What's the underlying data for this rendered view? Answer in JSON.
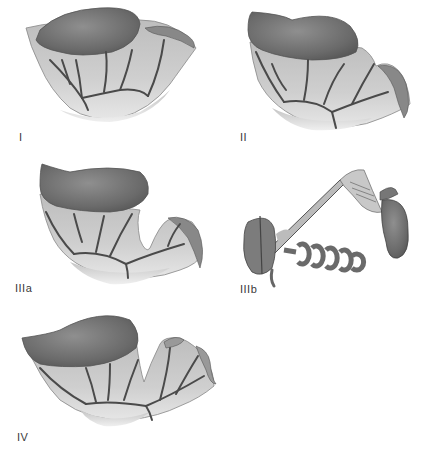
{
  "figure": {
    "title": "",
    "panels": [
      {
        "id": "I",
        "label": "I"
      },
      {
        "id": "II",
        "label": "II"
      },
      {
        "id": "IIIa",
        "label": "IIIa"
      },
      {
        "id": "IIIb",
        "label": "IIIb"
      },
      {
        "id": "IV",
        "label": "IV"
      }
    ]
  },
  "colors": {
    "background": "#ffffff",
    "organ_dark": "#6e6e6e",
    "organ_mid": "#8a8a8a",
    "tissue_light": "#c8c8c8",
    "tissue_lighter": "#dadada",
    "vessel": "#4a4a4a",
    "label_text": "#3a3a3a"
  }
}
